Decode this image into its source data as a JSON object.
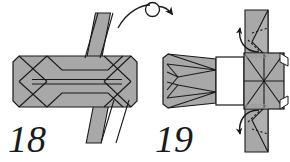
{
  "figure": {
    "background_color": "#ffffff",
    "paper_fill": "#a8a8a8",
    "paper_fill_light": "#b8b8b8",
    "paper_white": "#ffffff",
    "line_color": "#1a1a1a",
    "ink_color": "#1a1a1a"
  },
  "steps": [
    {
      "number": "18",
      "label_x": 8,
      "label_y": 152,
      "description": "Flat horizontal octagonal body with X creases at both ends, a horizontal slit through the middle, and a vertical flap projecting above and below the right of center."
    },
    {
      "number": "19",
      "label_x": 155,
      "label_y": 152,
      "description": "Model after turning over: tapered left body with converging creases, a white central panel, a square right end with X and cross creases, and vertical flaps above and below with dotted hidden fold lines."
    }
  ],
  "symbols": [
    {
      "name": "turn-over-arrow",
      "kind": "arc-with-loop",
      "meaning": "Turn the model over",
      "start_x": 118,
      "start_y": 27,
      "end_x": 175,
      "end_y": 18
    },
    {
      "name": "fold-arrow-top",
      "kind": "curved-arrow",
      "meaning": "Fold the top flap down and in"
    },
    {
      "name": "fold-arrow-bottom",
      "kind": "curved-arrow",
      "meaning": "Fold the bottom flap up and in"
    }
  ]
}
